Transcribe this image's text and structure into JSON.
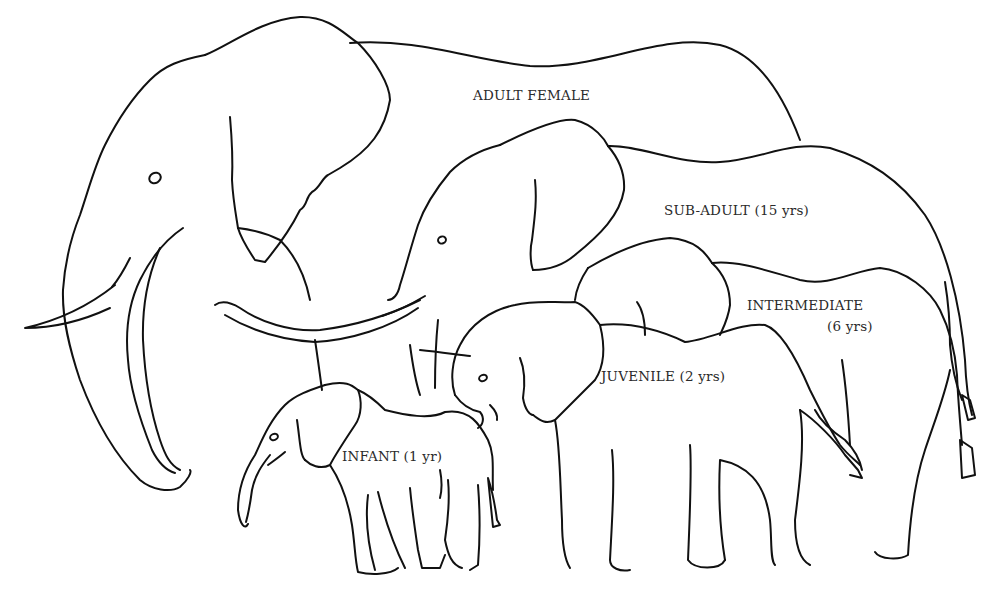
{
  "figure": {
    "type": "line-drawing",
    "stroke_color": "#111111",
    "background": "#ffffff"
  },
  "labels": {
    "adult_female": "ADULT FEMALE",
    "sub_adult": "SUB-ADULT (15 yrs)",
    "intermediate_line1": "INTERMEDIATE",
    "intermediate_line2": "(6 yrs)",
    "juvenile": "JUVENILE (2 yrs)",
    "infant": "INFANT (1 yr)"
  },
  "elephants": [
    {
      "id": "adult-female",
      "label_key": "adult_female"
    },
    {
      "id": "sub-adult",
      "label_key": "sub_adult",
      "age": "15 yrs"
    },
    {
      "id": "intermediate",
      "label_key": "intermediate",
      "age": "6 yrs"
    },
    {
      "id": "juvenile",
      "label_key": "juvenile",
      "age": "2 yrs"
    },
    {
      "id": "infant",
      "label_key": "infant",
      "age": "1 yr"
    }
  ]
}
